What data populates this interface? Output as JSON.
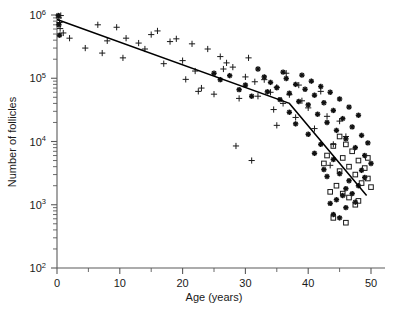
{
  "chart_data": {
    "type": "scatter",
    "title": "",
    "xlabel": "Age (years)",
    "ylabel": "Number of follicles",
    "xlim": [
      0,
      51
    ],
    "ylim": [
      100,
      1000000
    ],
    "yscale": "log",
    "xscale": "linear",
    "grid": false,
    "legend": "none",
    "xticks": [
      0,
      10,
      20,
      30,
      40,
      50
    ],
    "xtick_labels": [
      "0",
      "10",
      "20",
      "30",
      "40",
      "50"
    ],
    "yticks": [
      100,
      1000,
      10000,
      100000,
      1000000
    ],
    "ytick_labels": [
      "10",
      "10",
      "10",
      "10",
      "10"
    ],
    "ytick_exponents": [
      "2",
      "3",
      "4",
      "5",
      "6"
    ],
    "minor_ticks": true,
    "series": [
      {
        "name": "plus-marker-series",
        "marker": "plus",
        "color": "#1a1a1a",
        "points": [
          [
            0.3,
            900000
          ],
          [
            0.4,
            760000
          ],
          [
            0.5,
            610000
          ],
          [
            0.6,
            980000
          ],
          [
            1.0,
            520000
          ],
          [
            2.0,
            430000
          ],
          [
            4.5,
            300000
          ],
          [
            6.5,
            700000
          ],
          [
            7.2,
            250000
          ],
          [
            8.0,
            390000
          ],
          [
            9.5,
            640000
          ],
          [
            10.5,
            210000
          ],
          [
            11.0,
            430000
          ],
          [
            13.0,
            360000
          ],
          [
            14.0,
            290000
          ],
          [
            15.0,
            490000
          ],
          [
            16.0,
            560000
          ],
          [
            17.0,
            170000
          ],
          [
            18.0,
            380000
          ],
          [
            19.0,
            420000
          ],
          [
            20.0,
            190000
          ],
          [
            20.5,
            96000
          ],
          [
            21.5,
            350000
          ],
          [
            22.0,
            130000
          ],
          [
            22.5,
            62000
          ],
          [
            23.0,
            70000
          ],
          [
            24.0,
            290000
          ],
          [
            25.0,
            56000
          ],
          [
            26.0,
            220000
          ],
          [
            26.5,
            140000
          ],
          [
            27.0,
            175000
          ],
          [
            28.0,
            150000
          ],
          [
            29.0,
            48000
          ],
          [
            30.0,
            105000
          ],
          [
            30.5,
            210000
          ],
          [
            31.5,
            88000
          ],
          [
            32.0,
            52000
          ],
          [
            33.0,
            95000
          ],
          [
            34.0,
            60000
          ],
          [
            34.5,
            32000
          ],
          [
            35.0,
            72000
          ],
          [
            36.0,
            40000
          ],
          [
            36.5,
            120000
          ],
          [
            37.0,
            55000
          ],
          [
            38.0,
            24000
          ],
          [
            38.5,
            78000
          ],
          [
            39.0,
            44000
          ],
          [
            40.0,
            34000
          ],
          [
            41.0,
            16000
          ],
          [
            42.0,
            62000
          ],
          [
            43.0,
            25000
          ],
          [
            44.0,
            9000
          ],
          [
            45.0,
            21000
          ],
          [
            46.0,
            12000
          ],
          [
            35.0,
            18000
          ],
          [
            28.5,
            8500
          ],
          [
            31.0,
            5000
          ],
          [
            43.5,
            4200
          ]
        ]
      },
      {
        "name": "asterisk-marker-series",
        "marker": "asterisk",
        "color": "#111111",
        "points": [
          [
            0.2,
            980000
          ],
          [
            0.3,
            700000
          ],
          [
            0.4,
            480000
          ],
          [
            25.0,
            120000
          ],
          [
            26.0,
            95000
          ],
          [
            27.5,
            110000
          ],
          [
            29.0,
            66000
          ],
          [
            30.0,
            78000
          ],
          [
            31.0,
            52000
          ],
          [
            32.0,
            140000
          ],
          [
            33.0,
            105000
          ],
          [
            33.5,
            61000
          ],
          [
            34.0,
            86000
          ],
          [
            35.0,
            71000
          ],
          [
            35.5,
            46000
          ],
          [
            36.0,
            125000
          ],
          [
            36.5,
            99000
          ],
          [
            37.0,
            58000
          ],
          [
            38.0,
            80000
          ],
          [
            38.5,
            43000
          ],
          [
            39.0,
            112000
          ],
          [
            39.5,
            67000
          ],
          [
            40.0,
            38000
          ],
          [
            40.5,
            90000
          ],
          [
            41.0,
            54000
          ],
          [
            41.5,
            27000
          ],
          [
            42.0,
            74000
          ],
          [
            42.5,
            41000
          ],
          [
            43.0,
            20000
          ],
          [
            43.5,
            60000
          ],
          [
            44.0,
            31000
          ],
          [
            44.5,
            15000
          ],
          [
            45.0,
            47000
          ],
          [
            45.5,
            23000
          ],
          [
            46.0,
            11000
          ],
          [
            46.5,
            35000
          ],
          [
            47.0,
            17000
          ],
          [
            47.5,
            8000
          ],
          [
            48.0,
            26000
          ],
          [
            48.5,
            12500
          ],
          [
            49.0,
            6000
          ],
          [
            49.5,
            9500
          ],
          [
            50.0,
            4500
          ],
          [
            42.0,
            9000
          ],
          [
            44.0,
            5200
          ],
          [
            45.0,
            3100
          ],
          [
            46.5,
            2400
          ],
          [
            47.0,
            1500
          ],
          [
            43.0,
            2800
          ],
          [
            41.0,
            6500
          ],
          [
            48.0,
            2000
          ],
          [
            44.5,
            1200
          ],
          [
            46.0,
            1800
          ],
          [
            48.5,
            3500
          ],
          [
            40.0,
            13000
          ],
          [
            38.0,
            19000
          ],
          [
            37.0,
            29000
          ],
          [
            42.5,
            3600
          ],
          [
            45.5,
            1400
          ],
          [
            49.0,
            2700
          ],
          [
            43.5,
            1050
          ],
          [
            47.5,
            1100
          ],
          [
            44.0,
            700
          ],
          [
            45.0,
            620
          ],
          [
            46.0,
            900
          ]
        ]
      },
      {
        "name": "open-square-marker-series",
        "marker": "square",
        "color": "#1a1a1a",
        "points": [
          [
            44.0,
            8500
          ],
          [
            45.0,
            12000
          ],
          [
            45.5,
            5500
          ],
          [
            46.0,
            9000
          ],
          [
            46.5,
            4000
          ],
          [
            47.0,
            7000
          ],
          [
            47.5,
            3000
          ],
          [
            48.0,
            5000
          ],
          [
            48.5,
            2200
          ],
          [
            49.0,
            3800
          ],
          [
            49.5,
            2600
          ],
          [
            50.0,
            1900
          ],
          [
            44.5,
            2000
          ],
          [
            45.5,
            1500
          ],
          [
            46.5,
            1300
          ],
          [
            47.5,
            1000
          ],
          [
            43.5,
            1600
          ],
          [
            48.0,
            1150
          ],
          [
            44.0,
            620
          ],
          [
            46.0,
            520
          ],
          [
            45.0,
            3400
          ],
          [
            43.0,
            6000
          ],
          [
            49.5,
            5500
          ],
          [
            42.5,
            4500
          ]
        ]
      }
    ],
    "fit_line": {
      "name": "biphasic-regression-line",
      "color": "#000000",
      "description": "Biphasic log-linear decline with breakpoint near age 37",
      "vertices": [
        [
          0.0,
          850000
        ],
        [
          37.0,
          40000
        ],
        [
          49.3,
          1400
        ]
      ]
    }
  },
  "axes": {
    "x_axis_name": "age-axis",
    "y_axis_name": "follicle-count-axis"
  }
}
